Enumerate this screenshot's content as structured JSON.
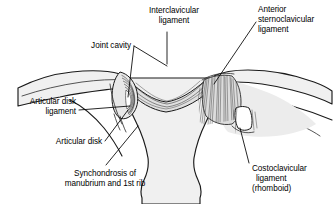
{
  "figure": {
    "background_color": "#ffffff",
    "line_color": "#1a1a1a",
    "bone_fill": "#f0f0f0",
    "cartilage_fill": "#e4e4e4",
    "ligament_fill": "#d2d2d2"
  },
  "labels": {
    "interclavicular": {
      "line1": "Interclavicular",
      "line2": "ligament"
    },
    "anterior_sternoclavicular": {
      "line1": "Anterior",
      "line2": "sternoclavicular",
      "line3": "ligament"
    },
    "joint_cavity": {
      "line1": "Joint cavity"
    },
    "articular_disk_ligament": {
      "line1": "Articular disk",
      "line2": "ligament"
    },
    "articular_disk": {
      "line1": "Articular disk"
    },
    "synchondrosis": {
      "line1": "Synchondrosis of",
      "line2": "manubrium and 1st rib"
    },
    "costoclavicular": {
      "line1": "Costoclavicular",
      "line2": "ligament",
      "line3": "(rhomboid)"
    }
  }
}
